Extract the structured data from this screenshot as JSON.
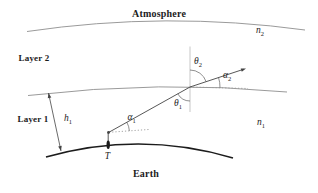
{
  "figure": {
    "region_top_label": "Atmosphere",
    "region_bottom_label": "Earth",
    "layer_labels": {
      "layer2": "Layer 2",
      "layer1": "Layer 1"
    },
    "math_labels": {
      "n2": {
        "base": "n",
        "sub": "2"
      },
      "n1": {
        "base": "n",
        "sub": "1"
      },
      "h1": {
        "base": "h",
        "sub": "1"
      },
      "theta2": {
        "base": "θ",
        "sub": "2"
      },
      "theta1": {
        "base": "θ",
        "sub": "1"
      },
      "alpha2": {
        "base": "α",
        "sub": "2"
      },
      "alpha1": {
        "base": "α",
        "sub": "1"
      },
      "t_point": "T"
    },
    "colors": {
      "background": "#ffffff",
      "curve": "#8f8f8f",
      "normal": "#b0b0b0",
      "dotted": "#9a9a9a",
      "ray": "#444444",
      "earth": "#1c1c1c",
      "text": "#1c1c1c"
    }
  }
}
